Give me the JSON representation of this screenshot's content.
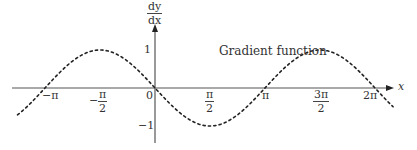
{
  "chart_data": {
    "type": "line",
    "title": "",
    "xlabel": "x",
    "ylabel": "dy/dx",
    "annotation": "Gradient function",
    "series": [
      {
        "name": "Gradient function",
        "function": "-sin(x)",
        "style": "dotted",
        "x": [
          -3.927,
          -3.1416,
          -1.5708,
          0,
          1.5708,
          3.1416,
          4.7124,
          6.2832,
          6.8
        ],
        "values": [
          -0.707,
          0,
          1,
          0,
          -1,
          0,
          1,
          0,
          -0.49
        ]
      }
    ],
    "x_ticks": [
      "−π",
      "−π/2",
      "0",
      "π/2",
      "π",
      "3π/2",
      "2π"
    ],
    "y_ticks": [
      "1",
      "−1"
    ],
    "xlim": [
      -4.0,
      6.9
    ],
    "ylim": [
      -1.3,
      1.8
    ],
    "grid": false,
    "legend": "none"
  },
  "labels": {
    "y_axis_num": "dy",
    "y_axis_den": "dx",
    "x_axis": "x",
    "y_tick_pos": "1",
    "y_tick_neg": "−1",
    "origin": "0",
    "neg_pi": "−π",
    "neg_half_pi_num": "π",
    "neg_half_pi_den": "2",
    "neg_sign": "−",
    "half_pi_num": "π",
    "half_pi_den": "2",
    "pi": "π",
    "three_half_pi_num": "3π",
    "three_half_pi_den": "2",
    "two_pi": "2π",
    "curve_label": "Gradient function"
  }
}
